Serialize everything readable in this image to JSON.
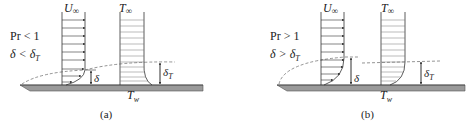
{
  "figure": {
    "colors": {
      "line": "#333333",
      "dash": "#666666",
      "plate": "#9a9a9a",
      "plate_edge": "#555555",
      "background": "#ffffff"
    },
    "panels": [
      {
        "id": "a",
        "caption": "(a)",
        "condition_pr": "Pr < 1",
        "condition_delta": "δ < δ",
        "condition_delta_sub": "T",
        "velocity_label": "U",
        "velocity_sub": "∞",
        "temperature_label": "T",
        "temperature_sub": "∞",
        "delta_label": "δ",
        "delta_t_label": "δ",
        "delta_t_sub": "T",
        "wall_label": "T",
        "wall_sub": "w"
      },
      {
        "id": "b",
        "caption": "(b)",
        "condition_pr": "Pr > 1",
        "condition_delta": "δ > δ",
        "condition_delta_sub": "T",
        "velocity_label": "U",
        "velocity_sub": "∞",
        "temperature_label": "T",
        "temperature_sub": "∞",
        "delta_label": "δ",
        "delta_t_label": "δ",
        "delta_t_sub": "T",
        "wall_label": "T",
        "wall_sub": "w"
      }
    ]
  }
}
